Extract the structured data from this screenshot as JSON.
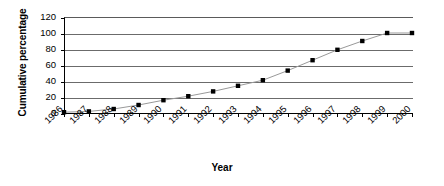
{
  "chart_data": {
    "type": "line",
    "title": "",
    "subtitle": "",
    "xlabel": "Year",
    "ylabel": "Cumulative percentage",
    "categories": [
      "1986",
      "1987",
      "1988",
      "1989",
      "1990",
      "1991",
      "1992",
      "1993",
      "1994",
      "1995",
      "1996",
      "1997",
      "1998",
      "1999",
      "2000"
    ],
    "values": [
      1,
      2,
      5,
      10,
      16,
      21,
      27,
      34,
      41,
      53,
      66,
      79,
      90,
      100,
      100
    ],
    "series": [
      {
        "name": "Cumulative percentage",
        "values": [
          1,
          2,
          5,
          10,
          16,
          21,
          27,
          34,
          41,
          53,
          66,
          79,
          90,
          100,
          100
        ]
      }
    ],
    "ylim": [
      0,
      120
    ],
    "yticks": [
      0,
      20,
      40,
      60,
      80,
      100,
      120
    ],
    "ytick_labels": [
      "0",
      "20",
      "40",
      "60",
      "80",
      "100",
      "120"
    ],
    "xtick_labels": [
      "1986",
      "1987",
      "1988",
      "1989",
      "1990",
      "1991",
      "1992",
      "1993",
      "1994",
      "1995",
      "1996",
      "1997",
      "1998",
      "1999",
      "2000"
    ],
    "grid": "horizontal",
    "legend": "none",
    "marker": "square",
    "marker_color": "#000000",
    "line_color": "#999999",
    "gridline_color": "#6b6b6b",
    "axis_color": "#000000",
    "background": "#ffffff",
    "xtick_label_rotation": -45
  }
}
